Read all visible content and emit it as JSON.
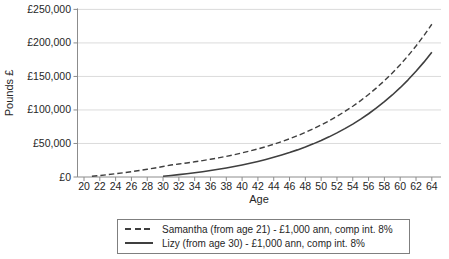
{
  "chart_data": {
    "type": "line",
    "title": "",
    "xlabel": "Age",
    "ylabel": "Pounds £",
    "xlim": [
      20,
      65
    ],
    "ylim": [
      0,
      250000
    ],
    "x_ticks": [
      20,
      22,
      24,
      26,
      28,
      30,
      32,
      34,
      36,
      38,
      40,
      42,
      44,
      46,
      48,
      50,
      52,
      54,
      56,
      58,
      60,
      62,
      64
    ],
    "y_ticks": [
      0,
      50000,
      100000,
      150000,
      200000,
      250000
    ],
    "y_tick_labels": [
      "£0",
      "£50,000",
      "£100,000",
      "£150,000",
      "£200,000",
      "£250,000"
    ],
    "grid": "horizontal",
    "legend_position": "bottom",
    "series": [
      {
        "name": "Samantha (from age 21) - £1,000 ann, comp int. 8%",
        "line_style": "dashed",
        "color": "#3f3f3f",
        "x": [
          21,
          22,
          23,
          24,
          25,
          26,
          27,
          28,
          29,
          30,
          31,
          32,
          33,
          34,
          35,
          36,
          37,
          38,
          39,
          40,
          41,
          42,
          43,
          44,
          45,
          46,
          47,
          48,
          49,
          50,
          51,
          52,
          53,
          54,
          55,
          56,
          57,
          58,
          59,
          60,
          61,
          62,
          63,
          64
        ],
        "y": [
          1080,
          2250,
          3510,
          4870,
          6340,
          7920,
          9640,
          11490,
          13490,
          15650,
          17980,
          19420,
          20970,
          22650,
          24460,
          26410,
          28530,
          30810,
          33270,
          35940,
          38810,
          41920,
          45270,
          48890,
          52800,
          57020,
          61590,
          66510,
          71830,
          77580,
          83790,
          90490,
          97730,
          105550,
          113990,
          123110,
          132960,
          143600,
          155080,
          167490,
          180890,
          195360,
          210990,
          227870
        ]
      },
      {
        "name": "Lizy (from age 30) - £1,000 ann, comp int. 8%",
        "line_style": "solid",
        "color": "#3f3f3f",
        "x": [
          30,
          31,
          32,
          33,
          34,
          35,
          36,
          37,
          38,
          39,
          40,
          41,
          42,
          43,
          44,
          45,
          46,
          47,
          48,
          49,
          50,
          51,
          52,
          53,
          54,
          55,
          56,
          57,
          58,
          59,
          60,
          61,
          62,
          63,
          64
        ],
        "y": [
          1080,
          2250,
          3510,
          4870,
          6340,
          7920,
          9640,
          11490,
          13490,
          15650,
          17980,
          20500,
          23210,
          26150,
          29320,
          32750,
          36450,
          40450,
          44760,
          49420,
          54460,
          59890,
          65770,
          72110,
          78950,
          86350,
          94340,
          102970,
          112280,
          122350,
          133210,
          144950,
          157630,
          171320,
          186100
        ]
      }
    ]
  },
  "colors": {
    "background": "#ffffff",
    "line": "#3f3f3f",
    "grid": "#dbdbdb",
    "axis": "#8c8c8c",
    "text": "#262626",
    "legend_border": "#7f7f7f"
  }
}
